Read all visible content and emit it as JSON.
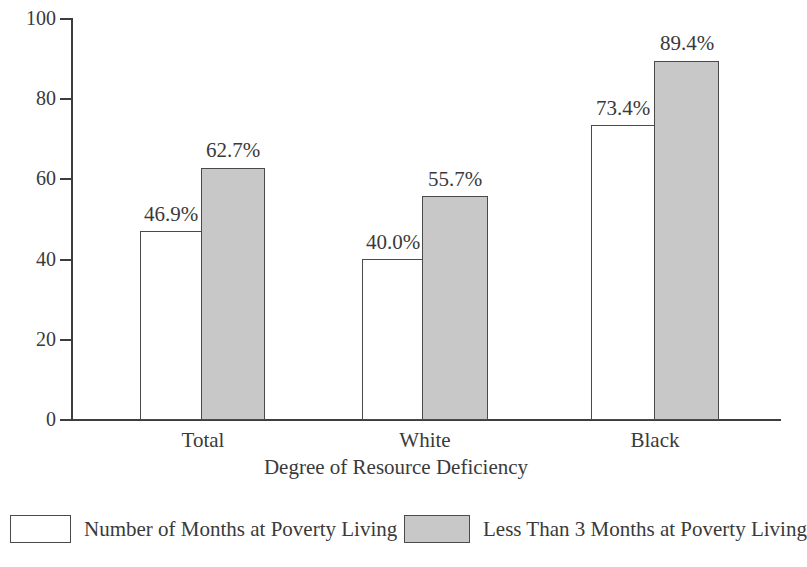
{
  "chart_data": {
    "type": "bar",
    "title": "",
    "xlabel": "Degree of Resource Deficiency",
    "ylabel": "",
    "categories": [
      "Total",
      "White",
      "Black"
    ],
    "ylim": [
      0,
      100
    ],
    "yticks": [
      0,
      20,
      40,
      60,
      80,
      100
    ],
    "ytick_labels": [
      "0",
      "20",
      "40",
      "60",
      "80",
      "100"
    ],
    "grid": false,
    "legend_position": "bottom",
    "series": [
      {
        "name": "Number of Months at Poverty Living",
        "values": [
          46.9,
          40.0,
          73.4
        ],
        "data_labels": [
          "46.9%",
          "40.0%",
          "73.4%"
        ],
        "fill": "#ffffff",
        "stroke": "#4a4a4a"
      },
      {
        "name": "Less Than 3 Months at Poverty Living",
        "values": [
          62.7,
          55.7,
          89.4
        ],
        "data_labels": [
          "62.7%",
          "55.7%",
          "89.4%"
        ],
        "fill": "#c8c8c8",
        "stroke": "#4a4a4a"
      }
    ]
  },
  "axes": {
    "y_ticks": [
      {
        "label": "100",
        "value": 100
      },
      {
        "label": "80",
        "value": 80
      },
      {
        "label": "60",
        "value": 60
      },
      {
        "label": "40",
        "value": 40
      },
      {
        "label": "20",
        "value": 20
      },
      {
        "label": "0",
        "value": 0
      }
    ],
    "x_title": "Degree of Resource Deficiency",
    "x_categories": [
      {
        "label": "Total"
      },
      {
        "label": "White"
      },
      {
        "label": "Black"
      }
    ]
  },
  "legend": {
    "items": [
      {
        "label": "Number of Months at Poverty Living",
        "style": "open"
      },
      {
        "label": "Less Than 3 Months at Poverty Living",
        "style": "filled"
      }
    ]
  },
  "groups": [
    {
      "name": "Total",
      "open": {
        "label": "46.9%",
        "value": 46.9
      },
      "filled": {
        "label": "62.7%",
        "value": 62.7
      }
    },
    {
      "name": "White",
      "open": {
        "label": "40.0%",
        "value": 40.0
      },
      "filled": {
        "label": "55.7%",
        "value": 55.7
      }
    },
    {
      "name": "Black",
      "open": {
        "label": "73.4%",
        "value": 73.4
      },
      "filled": {
        "label": "89.4%",
        "value": 89.4
      }
    }
  ]
}
